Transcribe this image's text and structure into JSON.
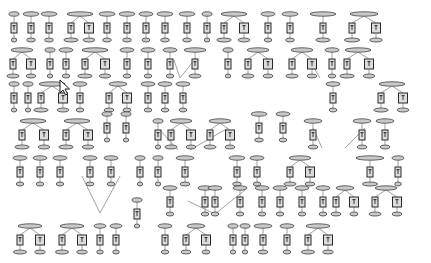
{
  "diagram": {
    "title": "",
    "background": "#ffffff",
    "node_label_note": "node labels not legible at this resolution",
    "colors": {
      "ellipse_fill": "#c9c9c9",
      "ellipse_stroke": "#404040",
      "box_fill": "#dcdcdc",
      "box_stroke": "#2a2a2a",
      "edge": "#8a8a8a"
    },
    "cursor": {
      "type": "arrow-pointer",
      "x": 60,
      "y": 80
    },
    "chains": [
      {
        "x": 14,
        "y": 14,
        "w": 10,
        "boxes": 1
      },
      {
        "x": 31,
        "y": 14,
        "w": 16,
        "boxes": 1
      },
      {
        "x": 49,
        "y": 14,
        "w": 16,
        "boxes": 1
      },
      {
        "x": 80,
        "y": 14,
        "w": 26,
        "boxes": 2,
        "spread": 18
      },
      {
        "x": 107,
        "y": 14,
        "w": 16,
        "boxes": 1
      },
      {
        "x": 127,
        "y": 14,
        "w": 16,
        "boxes": 1
      },
      {
        "x": 146,
        "y": 14,
        "w": 14,
        "boxes": 1
      },
      {
        "x": 165,
        "y": 14,
        "w": 16,
        "boxes": 1
      },
      {
        "x": 187,
        "y": 14,
        "w": 16,
        "boxes": 1
      },
      {
        "x": 207,
        "y": 14,
        "w": 10,
        "boxes": 1
      },
      {
        "x": 234,
        "y": 14,
        "w": 26,
        "boxes": 2,
        "spread": 20
      },
      {
        "x": 268,
        "y": 14,
        "w": 14,
        "boxes": 1
      },
      {
        "x": 290,
        "y": 14,
        "w": 16,
        "boxes": 1
      },
      {
        "x": 323,
        "y": 14,
        "w": 26,
        "boxes": 1
      },
      {
        "x": 364,
        "y": 14,
        "w": 28,
        "boxes": 2,
        "spread": 24
      },
      {
        "x": 22,
        "y": 50,
        "w": 22,
        "boxes": 2,
        "spread": 18
      },
      {
        "x": 50,
        "y": 50,
        "w": 10,
        "boxes": 1
      },
      {
        "x": 66,
        "y": 50,
        "w": 14,
        "boxes": 1
      },
      {
        "x": 95,
        "y": 50,
        "w": 26,
        "boxes": 2,
        "spread": 20
      },
      {
        "x": 127,
        "y": 50,
        "w": 14,
        "boxes": 1
      },
      {
        "x": 148,
        "y": 50,
        "w": 14,
        "boxes": 1
      },
      {
        "x": 170,
        "y": 50,
        "w": 14,
        "boxes": 1
      },
      {
        "x": 195,
        "y": 50,
        "w": 22,
        "boxes": 1
      },
      {
        "x": 228,
        "y": 50,
        "w": 10,
        "boxes": 1
      },
      {
        "x": 258,
        "y": 50,
        "w": 22,
        "boxes": 2,
        "spread": 20
      },
      {
        "x": 302,
        "y": 50,
        "w": 22,
        "boxes": 2,
        "spread": 20
      },
      {
        "x": 332,
        "y": 50,
        "w": 14,
        "boxes": 1
      },
      {
        "x": 358,
        "y": 50,
        "w": 26,
        "boxes": 2,
        "spread": 22
      },
      {
        "x": 14,
        "y": 84,
        "w": 10,
        "boxes": 1
      },
      {
        "x": 28,
        "y": 84,
        "w": 10,
        "boxes": 1
      },
      {
        "x": 52,
        "y": 84,
        "w": 26,
        "boxes": 2,
        "spread": 22
      },
      {
        "x": 80,
        "y": 84,
        "w": 14,
        "boxes": 1
      },
      {
        "x": 118,
        "y": 84,
        "w": 18,
        "boxes": 2,
        "spread": 18
      },
      {
        "x": 148,
        "y": 84,
        "w": 14,
        "boxes": 1
      },
      {
        "x": 165,
        "y": 84,
        "w": 14,
        "boxes": 1
      },
      {
        "x": 183,
        "y": 84,
        "w": 14,
        "boxes": 1
      },
      {
        "x": 333,
        "y": 84,
        "w": 14,
        "boxes": 1
      },
      {
        "x": 392,
        "y": 84,
        "w": 26,
        "boxes": 2,
        "spread": 22
      },
      {
        "x": 33,
        "y": 121,
        "w": 26,
        "boxes": 2,
        "spread": 22
      },
      {
        "x": 77,
        "y": 121,
        "w": 26,
        "boxes": 2,
        "spread": 22
      },
      {
        "x": 107,
        "y": 114,
        "w": 10,
        "boxes": 1
      },
      {
        "x": 126,
        "y": 114,
        "w": 10,
        "boxes": 1
      },
      {
        "x": 158,
        "y": 121,
        "w": 10,
        "boxes": 1
      },
      {
        "x": 181,
        "y": 121,
        "w": 22,
        "boxes": 2,
        "spread": 20
      },
      {
        "x": 220,
        "y": 121,
        "w": 22,
        "boxes": 2,
        "spread": 20
      },
      {
        "x": 259,
        "y": 114,
        "w": 16,
        "boxes": 1
      },
      {
        "x": 283,
        "y": 114,
        "w": 14,
        "boxes": 1
      },
      {
        "x": 313,
        "y": 121,
        "w": 18,
        "boxes": 1
      },
      {
        "x": 362,
        "y": 121,
        "w": 18,
        "boxes": 1
      },
      {
        "x": 385,
        "y": 121,
        "w": 18,
        "boxes": 1
      },
      {
        "x": 20,
        "y": 158,
        "w": 14,
        "boxes": 1
      },
      {
        "x": 40,
        "y": 158,
        "w": 14,
        "boxes": 1
      },
      {
        "x": 60,
        "y": 158,
        "w": 14,
        "boxes": 1
      },
      {
        "x": 90,
        "y": 158,
        "w": 14,
        "boxes": 1
      },
      {
        "x": 111,
        "y": 158,
        "w": 14,
        "boxes": 1
      },
      {
        "x": 140,
        "y": 158,
        "w": 10,
        "boxes": 1
      },
      {
        "x": 158,
        "y": 158,
        "w": 10,
        "boxes": 1
      },
      {
        "x": 185,
        "y": 158,
        "w": 18,
        "boxes": 1
      },
      {
        "x": 237,
        "y": 158,
        "w": 16,
        "boxes": 1
      },
      {
        "x": 257,
        "y": 158,
        "w": 14,
        "boxes": 1
      },
      {
        "x": 300,
        "y": 158,
        "w": 22,
        "boxes": 2,
        "spread": 20
      },
      {
        "x": 370,
        "y": 158,
        "w": 28,
        "boxes": 1
      },
      {
        "x": 398,
        "y": 158,
        "w": 12,
        "boxes": 1
      },
      {
        "x": 170,
        "y": 188,
        "w": 14,
        "boxes": 1
      },
      {
        "x": 205,
        "y": 188,
        "w": 14,
        "boxes": 1
      },
      {
        "x": 215,
        "y": 188,
        "w": 14,
        "boxes": 1
      },
      {
        "x": 240,
        "y": 188,
        "w": 14,
        "boxes": 1
      },
      {
        "x": 262,
        "y": 188,
        "w": 14,
        "boxes": 1
      },
      {
        "x": 280,
        "y": 188,
        "w": 14,
        "boxes": 1
      },
      {
        "x": 302,
        "y": 188,
        "w": 14,
        "boxes": 1
      },
      {
        "x": 323,
        "y": 188,
        "w": 14,
        "boxes": 1
      },
      {
        "x": 345,
        "y": 188,
        "w": 18,
        "boxes": 2,
        "spread": 18
      },
      {
        "x": 386,
        "y": 188,
        "w": 22,
        "boxes": 2,
        "spread": 22
      },
      {
        "x": 137,
        "y": 200,
        "w": 10,
        "boxes": 1
      },
      {
        "x": 30,
        "y": 226,
        "w": 24,
        "boxes": 2,
        "spread": 20
      },
      {
        "x": 72,
        "y": 226,
        "w": 24,
        "boxes": 2,
        "spread": 20
      },
      {
        "x": 100,
        "y": 226,
        "w": 12,
        "boxes": 1
      },
      {
        "x": 116,
        "y": 226,
        "w": 12,
        "boxes": 1
      },
      {
        "x": 165,
        "y": 226,
        "w": 14,
        "boxes": 1
      },
      {
        "x": 196,
        "y": 226,
        "w": 18,
        "boxes": 2,
        "spread": 20
      },
      {
        "x": 233,
        "y": 226,
        "w": 10,
        "boxes": 1
      },
      {
        "x": 245,
        "y": 226,
        "w": 10,
        "boxes": 1
      },
      {
        "x": 263,
        "y": 226,
        "w": 18,
        "boxes": 1
      },
      {
        "x": 287,
        "y": 226,
        "w": 14,
        "boxes": 1
      },
      {
        "x": 318,
        "y": 226,
        "w": 24,
        "boxes": 2,
        "spread": 20
      }
    ],
    "links": [
      {
        "x1": 174,
        "y1": 60,
        "x2": 180,
        "y2": 78
      },
      {
        "x1": 196,
        "y1": 58,
        "x2": 180,
        "y2": 78
      },
      {
        "x1": 308,
        "y1": 58,
        "x2": 320,
        "y2": 78
      },
      {
        "x1": 160,
        "y1": 130,
        "x2": 178,
        "y2": 150
      },
      {
        "x1": 228,
        "y1": 128,
        "x2": 190,
        "y2": 150
      },
      {
        "x1": 313,
        "y1": 128,
        "x2": 322,
        "y2": 148
      },
      {
        "x1": 365,
        "y1": 128,
        "x2": 345,
        "y2": 148
      },
      {
        "x1": 82,
        "y1": 176,
        "x2": 100,
        "y2": 213
      },
      {
        "x1": 120,
        "y1": 176,
        "x2": 100,
        "y2": 213
      },
      {
        "x1": 188,
        "y1": 201,
        "x2": 215,
        "y2": 214
      },
      {
        "x1": 245,
        "y1": 190,
        "x2": 215,
        "y2": 214
      }
    ]
  }
}
